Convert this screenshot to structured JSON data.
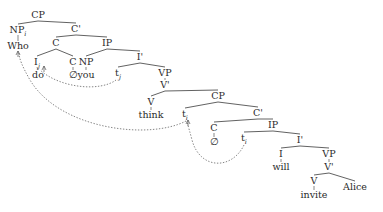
{
  "diagram": {
    "type": "syntax-tree",
    "nodes": {
      "cp_root": {
        "label": "CP"
      },
      "np_i": {
        "label": "NP",
        "sub": "i"
      },
      "who": {
        "label": "Who"
      },
      "c_bar_1": {
        "label": "C'"
      },
      "c_1": {
        "label": "C"
      },
      "ip_1": {
        "label": "IP"
      },
      "i_j": {
        "label": "I",
        "sub": "j"
      },
      "do": {
        "label": "do"
      },
      "c_2": {
        "label": "C"
      },
      "empty_c_2": {
        "label": "∅"
      },
      "np_you": {
        "label": "NP"
      },
      "you": {
        "label": "you"
      },
      "t_j": {
        "label": "t",
        "sub": "j"
      },
      "i_bar_1": {
        "label": "I'"
      },
      "vp_1": {
        "label": "VP"
      },
      "v_bar_1": {
        "label": "V'"
      },
      "v_1": {
        "label": "V"
      },
      "think": {
        "label": "think"
      },
      "cp_2": {
        "label": "CP"
      },
      "t_i_1": {
        "label": "t",
        "sub": "i"
      },
      "c_bar_2": {
        "label": "C'"
      },
      "c_3": {
        "label": "C"
      },
      "empty_c_3": {
        "label": "∅"
      },
      "ip_2": {
        "label": "IP"
      },
      "t_i_2": {
        "label": "t",
        "sub": "i"
      },
      "i_bar_2": {
        "label": "I'"
      },
      "i_2": {
        "label": "I"
      },
      "will": {
        "label": "will"
      },
      "vp_2": {
        "label": "VP"
      },
      "v_bar_2": {
        "label": "V'"
      },
      "v_2": {
        "label": "V"
      },
      "invite": {
        "label": "invite"
      },
      "alice": {
        "label": "Alice"
      }
    },
    "movements": [
      {
        "from": "t_j",
        "to": "i_j",
        "index": "j"
      },
      {
        "from": "t_i_1",
        "to": "who",
        "index": "i"
      },
      {
        "from": "t_i_2",
        "to": "t_i_1",
        "index": "i"
      }
    ]
  }
}
